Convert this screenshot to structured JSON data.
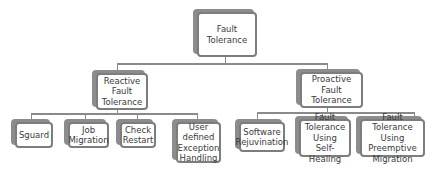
{
  "diagram": {
    "root": {
      "label": "Fault\nTolerance"
    },
    "branches": [
      {
        "label": "Reactive\nFault\nTolerance",
        "children": [
          {
            "label": "Sguard"
          },
          {
            "label": "Job\nMigration"
          },
          {
            "label": "Check\nRestart"
          },
          {
            "label": "User\ndefined\nException\nHandling"
          }
        ]
      },
      {
        "label": "Proactive\nFault\nTolerance",
        "children": [
          {
            "label": "Software\nRejuvination"
          },
          {
            "label": "Fault\nTolerance\nUsing\nSelf-Healing"
          },
          {
            "label": "Fault Tolerance\nUsing\nPreemptive\nMigration"
          }
        ]
      }
    ]
  },
  "colors": {
    "border": "#7d7d7d",
    "shadow": "#8c8c8c",
    "line": "#8a8a8a",
    "text": "#3a3a3a"
  }
}
